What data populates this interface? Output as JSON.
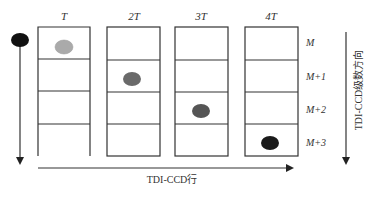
{
  "diagram": {
    "columns": [
      {
        "label": "T",
        "dot_row": 0,
        "dot_color": "#aaaaaa"
      },
      {
        "label": "2T",
        "dot_row": 1,
        "dot_color": "#6a6a6a"
      },
      {
        "label": "3T",
        "dot_row": 2,
        "dot_color": "#555555"
      },
      {
        "label": "4T",
        "dot_row": 3,
        "dot_color": "#1a1a1a"
      }
    ],
    "rows": [
      "M",
      "M+1",
      "M+2",
      "M+3"
    ],
    "moving_target_color": "#111111",
    "horizontal_axis_label": "TDI-CCD行",
    "vertical_axis_label": "TDI-CCD级数方向",
    "line_color": "#333333"
  }
}
